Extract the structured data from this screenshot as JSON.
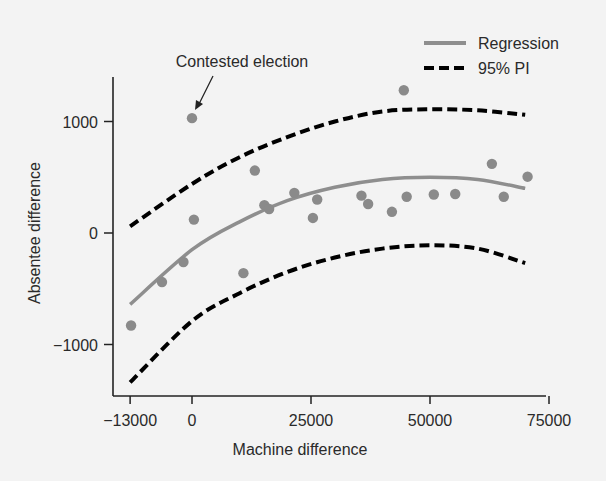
{
  "chart_data": {
    "type": "scatter",
    "title": "",
    "xlabel": "Machine difference",
    "ylabel": "Absentee difference",
    "xlim": [
      -13000,
      75000
    ],
    "ylim": [
      -1400,
      1400
    ],
    "x_ticks": [
      -13000,
      0,
      25000,
      50000,
      75000
    ],
    "x_tick_labels": [
      "−13000",
      "0",
      "25000",
      "50000",
      "75000"
    ],
    "y_ticks": [
      1000,
      0,
      -1000
    ],
    "y_tick_labels": [
      "1000",
      "0",
      "−1000"
    ],
    "grid": false,
    "legend_position": "top-right",
    "legend": [
      {
        "label": "Regression",
        "style": "solid",
        "color": "#8e8e8e"
      },
      {
        "label": "95% PI",
        "style": "dashed",
        "color": "#000000"
      }
    ],
    "annotations": [
      {
        "text": "Contested election",
        "x": 0,
        "y": 1030,
        "arrow": true
      }
    ],
    "points": {
      "name": "Elections",
      "color": "#8a8a8a",
      "x": [
        -12800,
        -6300,
        -1800,
        0,
        400,
        10800,
        13200,
        15200,
        16200,
        21500,
        25400,
        26300,
        35600,
        37000,
        42000,
        44500,
        45100,
        50800,
        55300,
        63000,
        65500,
        70500
      ],
      "y": [
        -830,
        -440,
        -260,
        1030,
        120,
        -360,
        560,
        250,
        215,
        360,
        135,
        300,
        335,
        260,
        190,
        1280,
        325,
        345,
        350,
        620,
        325,
        505
      ]
    },
    "series": [
      {
        "name": "Regression",
        "style": "solid",
        "x": [
          -13000,
          0,
          10000,
          20000,
          30000,
          40000,
          50000,
          60000,
          70000
        ],
        "y": [
          -640,
          -150,
          100,
          290,
          410,
          480,
          500,
          480,
          400
        ]
      },
      {
        "name": "95% PI upper",
        "style": "dashed",
        "x": [
          -13000,
          0,
          10000,
          20000,
          30000,
          40000,
          50000,
          60000,
          70000
        ],
        "y": [
          60,
          440,
          680,
          860,
          1000,
          1090,
          1110,
          1100,
          1060
        ]
      },
      {
        "name": "95% PI lower",
        "style": "dashed",
        "x": [
          -13000,
          0,
          10000,
          20000,
          30000,
          40000,
          50000,
          60000,
          70000
        ],
        "y": [
          -1340,
          -790,
          -540,
          -350,
          -220,
          -140,
          -110,
          -140,
          -270
        ]
      }
    ]
  }
}
